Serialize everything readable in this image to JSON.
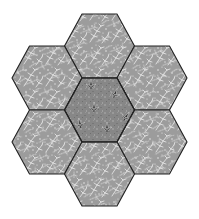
{
  "figure": {
    "background": "#ffffff",
    "border_color": "#222222",
    "hex_radius": 35,
    "hex_half_height": 32
  },
  "fabrics": {
    "outer": {
      "name": "gray vine print",
      "base": "#9c9c9c",
      "motif": "#e2e2e2"
    },
    "center": {
      "name": "dark gray leaf print",
      "base": "#878787",
      "motif": "#2a2a2a",
      "motif_outline": "#d8d8d8"
    }
  },
  "hexagons": [
    {
      "id": "top",
      "cx": 99.5,
      "cy": 46,
      "fabric": "outer"
    },
    {
      "id": "upper-left",
      "cx": 47,
      "cy": 78,
      "fabric": "outer"
    },
    {
      "id": "upper-right",
      "cx": 152,
      "cy": 78,
      "fabric": "outer"
    },
    {
      "id": "center",
      "cx": 99.5,
      "cy": 110,
      "fabric": "center"
    },
    {
      "id": "lower-left",
      "cx": 47,
      "cy": 142,
      "fabric": "outer"
    },
    {
      "id": "lower-right",
      "cx": 152,
      "cy": 142,
      "fabric": "outer"
    },
    {
      "id": "bottom",
      "cx": 99.5,
      "cy": 174,
      "fabric": "outer"
    }
  ],
  "center_leaves": [
    {
      "x": 91,
      "y": 85,
      "rot": 0
    },
    {
      "x": 115,
      "y": 94,
      "rot": 20
    },
    {
      "x": 94,
      "y": 108,
      "rot": 0
    },
    {
      "x": 126,
      "y": 117,
      "rot": 30
    },
    {
      "x": 80,
      "y": 124,
      "rot": -10
    },
    {
      "x": 107,
      "y": 128,
      "rot": 0
    }
  ]
}
